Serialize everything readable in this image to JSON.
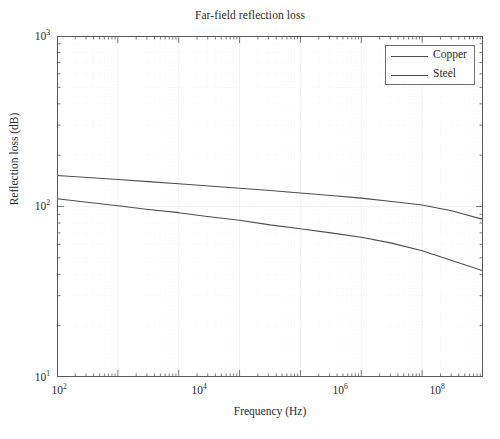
{
  "chart_data": {
    "type": "line",
    "title": "Far-field reflection loss",
    "xlabel": "Frequency (Hz)",
    "ylabel": "Reflection loss (dB)",
    "xscale": "log",
    "yscale": "log",
    "xlim": [
      100,
      1000000000
    ],
    "ylim": [
      10,
      1000
    ],
    "grid": true,
    "grid_minor": true,
    "legend_position": "top-right",
    "xtick_labels": [
      "10²",
      "10⁴",
      "10⁶",
      "10⁸"
    ],
    "xtick_values": [
      100,
      10000,
      1000000,
      100000000
    ],
    "ytick_labels": [
      "10¹",
      "10²",
      "10³"
    ],
    "ytick_values": [
      10,
      100,
      1000
    ],
    "x": [
      100,
      316,
      1000,
      3160,
      10000,
      31600,
      100000,
      316000,
      1000000,
      3160000,
      10000000,
      31600000,
      100000000,
      316000000,
      1000000000
    ],
    "series": [
      {
        "name": "Copper",
        "color": "#4d4d4d",
        "values": [
          152,
          148,
          144,
          140,
          136,
          132,
          128,
          124,
          120,
          116,
          112,
          107,
          102,
          94,
          84
        ]
      },
      {
        "name": "Steel",
        "color": "#4d4d4d",
        "values": [
          111,
          106,
          101,
          96,
          92,
          87,
          83,
          78,
          74,
          70,
          66,
          61,
          55,
          48,
          42
        ]
      }
    ]
  },
  "legend": {
    "entries": [
      {
        "label": "Copper"
      },
      {
        "label": "Steel"
      }
    ]
  },
  "colors": {
    "axis": "#5a5a5a",
    "curve": "#4d4d4d",
    "grid": "#f2f2f2",
    "text": "#2b2b2b",
    "background": "#ffffff"
  }
}
